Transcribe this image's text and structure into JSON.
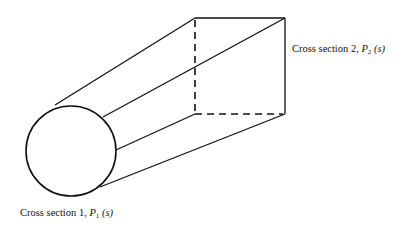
{
  "diagram": {
    "labels": {
      "section1": {
        "prefix": "Cross section 1, ",
        "symbol": "P",
        "subscript": "1",
        "argument": " (s)"
      },
      "section2": {
        "prefix": "Cross section 2, ",
        "symbol": "P",
        "subscript": "2",
        "argument": " (s)"
      }
    },
    "shapes": {
      "section1_shape": "circle",
      "section2_shape": "square",
      "hidden_edges_style": "dashed"
    }
  }
}
